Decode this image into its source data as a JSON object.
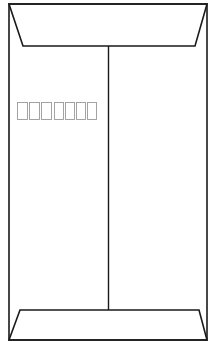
{
  "figure": {
    "orientation": "portrait",
    "colors": {
      "background": "#ffffff",
      "outline": "#1a1a1a",
      "postal_boxes": "#9a9a9a"
    },
    "outline": {
      "left": 9,
      "right": 207,
      "top": 4,
      "bottom": 340
    },
    "top_flap": {
      "outer_left": 9,
      "outer_right": 207,
      "top": 4,
      "inner_left": 23,
      "inner_right": 195,
      "bottom": 46
    },
    "bottom_flap": {
      "inner_left": 20,
      "inner_right": 199,
      "top": 310,
      "outer_left": 9,
      "outer_right": 207,
      "bottom": 340
    },
    "center_seam": {
      "x": 108.5,
      "y1": 46,
      "y2": 310
    },
    "postal_code_boxes": {
      "y": 102,
      "height": 17,
      "boxes": [
        {
          "x": 17,
          "w": 10
        },
        {
          "x": 29,
          "w": 10
        },
        {
          "x": 41,
          "w": 10
        },
        {
          "x": 54,
          "w": 9
        },
        {
          "x": 65,
          "w": 9
        },
        {
          "x": 76,
          "w": 9
        },
        {
          "x": 87,
          "w": 9
        }
      ]
    }
  }
}
